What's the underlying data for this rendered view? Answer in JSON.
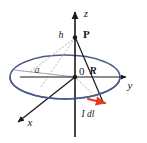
{
  "figure": {
    "type": "physics-vector-diagram",
    "background_color": "#ffffff",
    "width": 147,
    "height": 143
  },
  "colors": {
    "axis": "#1a1a1a",
    "loop": "#4a5a8a",
    "radius_line": "#8a8a9a",
    "dotted_guide": "#b0a8a0",
    "current_arrow": "#e03c1e",
    "text": "#1a1a1a"
  },
  "axes": [
    {
      "id": "z",
      "label": "z",
      "label_x": 86,
      "label_y": 17,
      "direction": "up",
      "arrow": true
    },
    {
      "id": "y",
      "label": "y",
      "label_x": 130,
      "label_y": 87,
      "direction": "right",
      "arrow": true
    },
    {
      "id": "x",
      "label": "x",
      "label_x": 30,
      "label_y": 125,
      "direction": "lower-left",
      "arrow": true
    }
  ],
  "origin": {
    "label": "0",
    "x": 75,
    "y": 76,
    "label_x": 80,
    "label_y": 74
  },
  "points": [
    {
      "id": "field-point",
      "label": "P",
      "x": 75,
      "y": 37,
      "label_x": 83,
      "label_y": 35,
      "bold": true
    }
  ],
  "segments": [
    {
      "id": "height",
      "label": "h",
      "label_x": 60,
      "label_y": 37,
      "description": "Distance from origin O to field point P along the z-axis"
    },
    {
      "id": "radius",
      "label": "a",
      "label_x": 37,
      "label_y": 71,
      "description": "Radius of the circular current loop"
    },
    {
      "id": "separation-vector",
      "label": "R",
      "label_x": 92,
      "label_y": 73,
      "description": "Vector from the current element to the field point P"
    }
  ],
  "current_element": {
    "label": "I dl",
    "label_x": 88,
    "label_y": 116,
    "arrow_tip_x": 107,
    "arrow_tip_y": 103,
    "color": "#e03c1e",
    "description": "Differential current element on the loop"
  },
  "loop": {
    "center_x": 65,
    "center_y": 77,
    "radius_x": 55,
    "radius_y": 22,
    "color": "#4a5a8a",
    "description": "Circular current-carrying loop drawn in perspective as an ellipse"
  }
}
